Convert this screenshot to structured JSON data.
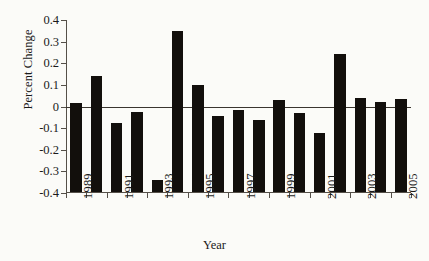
{
  "chart_data": {
    "type": "bar",
    "title": "",
    "xlabel": "Year",
    "ylabel": "Percent Change",
    "ylim": [
      -0.4,
      0.4
    ],
    "ytick_labels": [
      "0.4",
      "0.3",
      "0.2",
      "0.1",
      "0",
      "-0.1",
      "-0.2",
      "-0.3",
      "-0.4"
    ],
    "ytick_values": [
      0.4,
      0.3,
      0.2,
      0.1,
      0,
      -0.1,
      -0.2,
      -0.3,
      -0.4
    ],
    "xtick_labels": [
      "1989",
      "1991",
      "1993",
      "1995",
      "1997",
      "1999",
      "2001",
      "2003",
      "2005"
    ],
    "grid": false,
    "legend": false,
    "bar_color": "#120f0c",
    "zero_line": true,
    "categories": [
      "1989",
      "1990",
      "1991",
      "1992",
      "1993",
      "1994",
      "1995",
      "1996",
      "1997",
      "1998",
      "1999",
      "2000",
      "2001",
      "2002",
      "2003",
      "2004",
      "2005"
    ],
    "values": [
      0.012,
      0.135,
      -0.083,
      -0.03,
      -0.343,
      0.345,
      0.095,
      -0.05,
      -0.02,
      -0.065,
      0.027,
      -0.033,
      -0.128,
      0.238,
      0.035,
      0.014,
      0.031
    ]
  }
}
